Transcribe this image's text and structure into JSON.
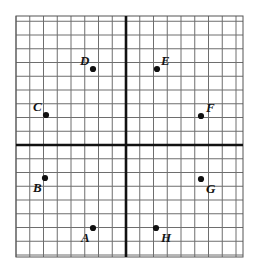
{
  "figure": {
    "type": "coordinate-grid",
    "background_color": "#ffffff",
    "grid": {
      "minor_line_color": "#6e6e6e",
      "minor_line_width": 1,
      "axis_line_color": "#111111",
      "axis_line_width": 2.6,
      "border_color": "#555555",
      "cell_size_px": 13.75,
      "left_px": 16,
      "top_px": 16,
      "right_px": 243,
      "bottom_px": 257,
      "origin_x_px": 126,
      "origin_y_px": 145,
      "columns": 16,
      "rows": 17,
      "x_range": [
        -8,
        8
      ],
      "y_range": [
        -8,
        9
      ],
      "show_tick_numbers": false,
      "show_axis_labels": false
    },
    "point_style": {
      "color": "#111111",
      "radius_px": 3.1
    }
  },
  "chart_data": {
    "type": "scatter",
    "xlabel": "",
    "ylabel": "",
    "xlim": [
      -8,
      8
    ],
    "ylim": [
      -8,
      9
    ],
    "grid": true,
    "legend": "none",
    "labels": [
      "A",
      "B",
      "C",
      "D",
      "E",
      "F",
      "G",
      "H"
    ],
    "x": [
      -2,
      -6,
      -6,
      -2,
      2,
      5,
      5,
      2
    ],
    "y": [
      -6,
      -2,
      2,
      5,
      5,
      2,
      -2,
      -6
    ],
    "points": [
      {
        "label": "A",
        "x": -2,
        "y": -6,
        "px": 93,
        "py": 228,
        "label_px": 81,
        "label_py": 231,
        "label_anchor": "below-left"
      },
      {
        "label": "B",
        "x": -6,
        "y": -2,
        "px": 45,
        "py": 178,
        "label_px": 33,
        "label_py": 181,
        "label_anchor": "below-left"
      },
      {
        "label": "C",
        "x": -6,
        "y": 2,
        "px": 46,
        "py": 115,
        "label_px": 33,
        "label_py": 100,
        "label_anchor": "above-left"
      },
      {
        "label": "D",
        "x": -2,
        "y": 5,
        "px": 93,
        "py": 69,
        "label_px": 80,
        "label_py": 54,
        "label_anchor": "above-left"
      },
      {
        "label": "E",
        "x": 2,
        "y": 5,
        "px": 157,
        "py": 69,
        "label_px": 161,
        "label_py": 54,
        "label_anchor": "above-right"
      },
      {
        "label": "F",
        "x": 5,
        "y": 2,
        "px": 201,
        "py": 116,
        "label_px": 206,
        "label_py": 101,
        "label_anchor": "above-right"
      },
      {
        "label": "G",
        "x": 5,
        "y": -2,
        "px": 201,
        "py": 179,
        "label_px": 206,
        "label_py": 182,
        "label_anchor": "below-right"
      },
      {
        "label": "H",
        "x": 2,
        "y": -6,
        "px": 156,
        "py": 228,
        "label_px": 161,
        "label_py": 231,
        "label_anchor": "below-right"
      }
    ]
  }
}
